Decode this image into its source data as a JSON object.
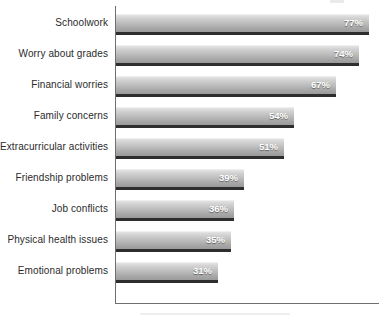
{
  "chart_data": {
    "type": "bar",
    "orientation": "horizontal",
    "title": "",
    "subtitle": "",
    "xlabel": "",
    "ylabel": "",
    "categories": [
      "Schoolwork",
      "Worry about grades",
      "Financial worries",
      "Family concerns",
      "Extracurricular activities",
      "Friendship problems",
      "Job conflicts",
      "Physical health issues",
      "Emotional problems"
    ],
    "values": [
      77,
      74,
      67,
      54,
      51,
      39,
      36,
      35,
      31
    ],
    "value_labels": [
      "77%",
      "74%",
      "67%",
      "54%",
      "51%",
      "39%",
      "36%",
      "35%",
      "31%"
    ],
    "value_unit": "%",
    "xlim": [
      0,
      80
    ],
    "grid": false,
    "legend": false,
    "legend_position": "none",
    "bar_color_top": "#e3e3e3",
    "bar_color_bottom": "#9a9a9a",
    "bar_shadow_color": "#2e2e2e",
    "axis_color": "#6f6f6f",
    "label_color": "#2b2b2b",
    "value_label_color": "#ffffff",
    "background_color": "#ffffff"
  },
  "layout": {
    "axis_x_px": 116,
    "px_per_percent": 3.29,
    "row_pitch_px": 31,
    "first_row_top_px": 14,
    "bar_height_px": 18
  }
}
